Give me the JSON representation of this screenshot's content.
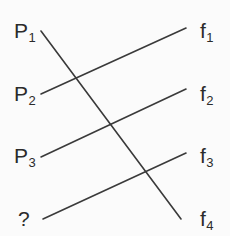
{
  "figure": {
    "background_color": "#fbfbfb",
    "line_color": "#3a3a3a",
    "text_color": "#2b2b2b",
    "width": 230,
    "height": 236
  },
  "left_nodes": [
    {
      "id": "p1",
      "base": "P",
      "sub": "1",
      "text": "P1",
      "x": 14,
      "y": 30
    },
    {
      "id": "p2",
      "base": "P",
      "sub": "2",
      "text": "P2",
      "x": 14,
      "y": 93
    },
    {
      "id": "p3",
      "base": "P",
      "sub": "3",
      "text": "P3",
      "x": 14,
      "y": 155
    },
    {
      "id": "unknown",
      "base": "?",
      "sub": "",
      "text": "?",
      "x": 18,
      "y": 218
    }
  ],
  "right_nodes": [
    {
      "id": "f1",
      "base": "f",
      "sub": "1",
      "text": "f1",
      "x": 200,
      "y": 30
    },
    {
      "id": "f2",
      "base": "f",
      "sub": "2",
      "text": "f2",
      "x": 200,
      "y": 93
    },
    {
      "id": "f3",
      "base": "f",
      "sub": "3",
      "text": "f3",
      "x": 200,
      "y": 155
    },
    {
      "id": "f4",
      "base": "f",
      "sub": "4",
      "text": "f4",
      "x": 200,
      "y": 218
    }
  ],
  "connections": [
    {
      "id": "p1-f4",
      "from": "p1",
      "to": "f4",
      "x1": 41,
      "y1": 31,
      "x2": 181,
      "y2": 219,
      "direction": "descending"
    },
    {
      "id": "p2-f1",
      "from": "p2",
      "to": "f1",
      "x1": 41,
      "y1": 94,
      "x2": 186,
      "y2": 28,
      "direction": "ascending"
    },
    {
      "id": "p3-f2",
      "from": "p3",
      "to": "f2",
      "x1": 41,
      "y1": 157,
      "x2": 186,
      "y2": 89,
      "direction": "ascending"
    },
    {
      "id": "unknown-f3",
      "from": "unknown",
      "to": "f3",
      "x1": 43,
      "y1": 219,
      "x2": 186,
      "y2": 153,
      "direction": "ascending"
    }
  ],
  "chart_data": {
    "type": "diagram",
    "diagram_kind": "bipartite-matching",
    "title": "",
    "left_labels": [
      "P1",
      "P2",
      "P3",
      "?"
    ],
    "right_labels": [
      "f1",
      "f2",
      "f3",
      "f4"
    ],
    "edges": [
      [
        "P1",
        "f4"
      ],
      [
        "P2",
        "f1"
      ],
      [
        "P3",
        "f2"
      ],
      [
        "?",
        "f3"
      ]
    ]
  }
}
